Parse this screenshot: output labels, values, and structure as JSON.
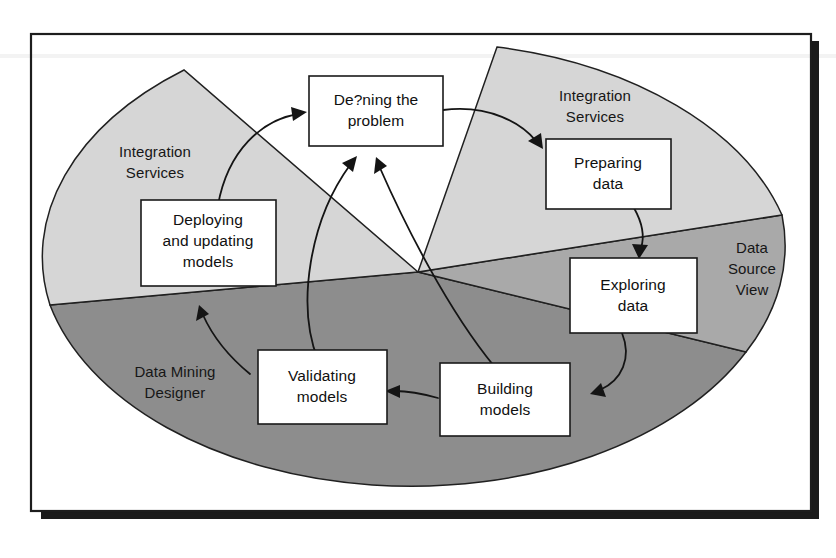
{
  "figure": {
    "background_color": "#ffffff",
    "frame": {
      "border_color": "#1d1d1d",
      "shadow_color": "#1b1b1b"
    }
  },
  "palette": {
    "light_gray": "#d6d6d6",
    "medium_gray": "#a9a9a9",
    "dark_gray": "#8d8d8d",
    "outline": "#202020",
    "box_fill": "#ffffff",
    "text": "#111111"
  },
  "sectors": [
    {
      "id": "integration-services-left",
      "label_line_1": "Integration",
      "label_line_2": "Services",
      "color": "#d6d6d6",
      "tone": "light"
    },
    {
      "id": "integration-services-top-right",
      "label_line_1": "Integration",
      "label_line_2": "Services",
      "color": "#d6d6d6",
      "tone": "light"
    },
    {
      "id": "data-source-view",
      "label_line_1": "Data",
      "label_line_2": "Source",
      "label_line_3": "View",
      "color": "#a9a9a9",
      "tone": "medium"
    },
    {
      "id": "data-mining-designer",
      "label_line_1": "Data Mining",
      "label_line_2": "Designer",
      "color": "#8d8d8d",
      "tone": "dark"
    }
  ],
  "nodes": [
    {
      "id": "defining-the-problem",
      "line_1": "De?ning the",
      "line_2": "problem",
      "line_3": ""
    },
    {
      "id": "preparing-data",
      "line_1": "Preparing",
      "line_2": "data",
      "line_3": ""
    },
    {
      "id": "exploring-data",
      "line_1": "Exploring",
      "line_2": "data",
      "line_3": ""
    },
    {
      "id": "building-models",
      "line_1": "Building",
      "line_2": "models",
      "line_3": ""
    },
    {
      "id": "validating-models",
      "line_1": "Validating",
      "line_2": "models",
      "line_3": ""
    },
    {
      "id": "deploying-and-updating-models",
      "line_1": "Deploying",
      "line_2": "and updating",
      "line_3": "models"
    }
  ],
  "flows": [
    {
      "id": "defining-to-preparing",
      "from": "defining-the-problem",
      "to": "preparing-data"
    },
    {
      "id": "preparing-to-exploring",
      "from": "preparing-data",
      "to": "exploring-data"
    },
    {
      "id": "exploring-to-building",
      "from": "exploring-data",
      "to": "building-models"
    },
    {
      "id": "building-to-validating",
      "from": "building-models",
      "to": "validating-models"
    },
    {
      "id": "validating-to-deploying",
      "from": "validating-models",
      "to": "deploying-and-updating-models"
    },
    {
      "id": "deploying-to-defining",
      "from": "deploying-and-updating-models",
      "to": "defining-the-problem"
    },
    {
      "id": "validating-to-defining",
      "from": "validating-models",
      "to": "defining-the-problem"
    },
    {
      "id": "building-to-defining",
      "from": "building-models",
      "to": "defining-the-problem"
    }
  ]
}
